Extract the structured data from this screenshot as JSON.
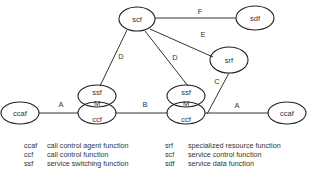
{
  "diagram": {
    "nodes": {
      "scf": {
        "label": "scf"
      },
      "sdf": {
        "label": "sdf"
      },
      "srf": {
        "label": "srf"
      },
      "ssf_left": {
        "label": "ssf"
      },
      "ccf_left": {
        "label": "ccf"
      },
      "ssf_right": {
        "label": "ssf"
      },
      "ccf_right": {
        "label": "ccf"
      },
      "ccaf_left": {
        "label": "ccaf"
      },
      "ccaf_right": {
        "label": "ccaf"
      },
      "m_left": {
        "label": "M"
      },
      "m_right": {
        "label": "M"
      }
    },
    "edges": {
      "scf_sdf": {
        "label": "F"
      },
      "scf_srf": {
        "label": "E"
      },
      "scf_ssf_left": {
        "label": "D"
      },
      "scf_ssf_right": {
        "label": "D"
      },
      "srf_ccf_right": {
        "label": "C"
      },
      "ccf_left_ccf_right": {
        "label": "B"
      },
      "ccaf_left_ccf_left": {
        "label": "A"
      },
      "ccf_right_ccaf_right": {
        "label": "A"
      }
    }
  },
  "legend": {
    "left": [
      {
        "abbr": "ccaf",
        "desc": "call control agent function"
      },
      {
        "abbr": "ccf",
        "desc": "call control function"
      },
      {
        "abbr": "ssf",
        "desc": "service switching function"
      }
    ],
    "right": [
      {
        "abbr": "srf",
        "desc": "specialized resource function"
      },
      {
        "abbr": "scf",
        "desc": "service control function"
      },
      {
        "abbr": "sdf",
        "desc": "service data function"
      }
    ]
  }
}
